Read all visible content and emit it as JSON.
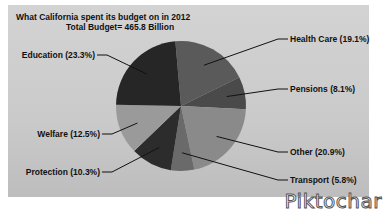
{
  "chart_data": {
    "type": "pie",
    "title": "What California spent its budget on in 2012",
    "subtitle": "Total Budget= 465.8 Billion",
    "categories": [
      "Health Care",
      "Pensions",
      "Other",
      "Transport",
      "Protection",
      "Welfare",
      "Education"
    ],
    "values": [
      19.1,
      8.1,
      20.9,
      5.8,
      10.3,
      12.5,
      23.3
    ],
    "unit": "%",
    "labels": [
      "Health Care (19.1%)",
      "Pensions (8.1%)",
      "Other (20.9%)",
      "Transport (5.8%)",
      "Protection (10.3%)",
      "Welfare (12.5%)",
      "Education (23.3%)"
    ],
    "colors": [
      "#5a5a5a",
      "#4a4a4a",
      "#8a8a8a",
      "#6a6a6a",
      "#2c2c2c",
      "#9a9a9a",
      "#262626"
    ],
    "legend": "callout labels"
  },
  "header": {
    "title": "What California spent its budget on in 2012",
    "subtitle": "Total Budget= 465.8 Billion"
  },
  "watermark": "Piktochar"
}
